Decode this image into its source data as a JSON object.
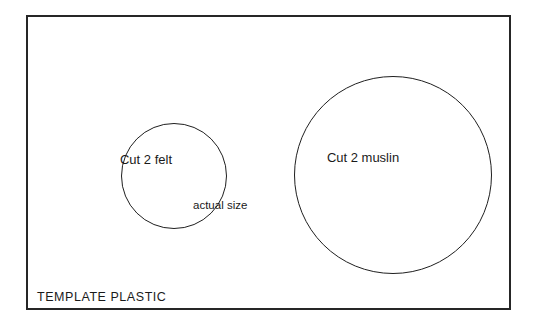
{
  "sheet": {
    "name": "template-plastic-sheet",
    "bottom_label": "TEMPLATE PLASTIC",
    "border_color": "#262626",
    "background_color": "#ffffff"
  },
  "pieces": [
    {
      "id": "small-circle",
      "label": "Cut 2 felt",
      "shape": "circle",
      "stroke_color": "#1f1f1f"
    },
    {
      "id": "large-circle",
      "label": "Cut 2 muslin",
      "shape": "circle",
      "stroke_color": "#1f1f1f"
    }
  ],
  "annotations": {
    "scale_note": "actual size"
  }
}
